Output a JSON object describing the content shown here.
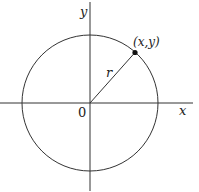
{
  "diagram": {
    "type": "unit-circle",
    "colors": {
      "stroke": "#333333",
      "point": "#111111",
      "background": "#ffffff"
    },
    "axes": {
      "x_label": "x",
      "y_label": "y",
      "origin_label": "0"
    },
    "radius_label": "r",
    "point_label": "(x,y)"
  }
}
